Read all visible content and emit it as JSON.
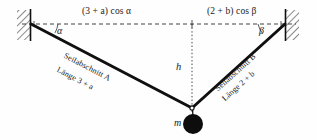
{
  "figure": {
    "background_color": "#fefefe",
    "line_color": "#101010",
    "mass_color": "#0d0d0d"
  },
  "labels": {
    "top_left": "(3 + a) cos α",
    "top_right": "(2 + b) cos β",
    "angle_left": "α",
    "angle_right": "β",
    "height": "h",
    "mass": "m",
    "rope_left_name": "Seilabschnitt A",
    "rope_left_length": "Länge 3 + a",
    "rope_right_name": "Seilabschnitt B",
    "rope_right_length": "Länge 2 + b"
  },
  "geometry": {
    "left_anchor_x": 31,
    "left_anchor_y": 24,
    "right_anchor_x": 285,
    "right_anchor_y": 24,
    "junction_x": 192,
    "junction_y": 108,
    "mass_center_x": 193,
    "mass_center_y": 124,
    "mass_radius": 10,
    "dashed_line_y": 24
  },
  "elements": {
    "left_wall": "hatched-support",
    "right_wall": "hatched-support",
    "horizontal_guide": "dashed",
    "vertical_guide": "dotted",
    "mass_shape": "filled-circle"
  }
}
